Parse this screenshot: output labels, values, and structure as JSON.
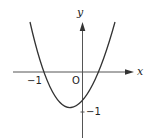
{
  "figure": {
    "type": "parabola-graph",
    "axes": {
      "x_label": "x",
      "y_label": "y",
      "origin_label": "O"
    },
    "labels": {
      "x_tick_neg1": "−1",
      "y_tick_neg1": "−1"
    },
    "curve": {
      "description": "upward-opening parabola",
      "x_intercepts": [
        "−1",
        "positive root between 0 and 1"
      ],
      "vertex": "left of y-axis, below −1 level slightly above? near y≈−1.1",
      "y_intercept": "just above −1"
    },
    "colors": {
      "stroke": "#333333",
      "background": "#ffffff"
    }
  }
}
